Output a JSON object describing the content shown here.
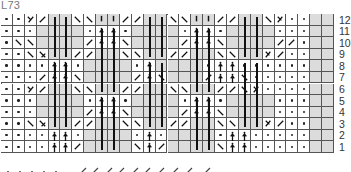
{
  "title": "L73",
  "grid": {
    "cols": 28,
    "rows": 12,
    "legend_codes": {
      "p": "purl-dot",
      "g": "gray-empty",
      "v": "short-vertical-knit",
      "r": "right-slant",
      "l": "left-slant",
      "y": "y-decrease",
      "k": "k-decrease",
      "a": "arrow-up-dot",
      "w": "white-empty"
    },
    "rows_top_to_bottom": [
      {
        "row": "12",
        "cells": [
          "p",
          "p",
          "y",
          "r",
          "g",
          "g",
          "l",
          "l",
          "v",
          "v",
          "r",
          "r",
          "g",
          "g",
          "l",
          "l",
          "v",
          "v",
          "r",
          "r",
          "g",
          "g",
          "l",
          "k",
          "p",
          "p",
          "g",
          "g"
        ]
      },
      {
        "row": "11",
        "cells": [
          "p",
          "p",
          "p",
          "g",
          "g",
          "g",
          "g",
          "p",
          "a",
          "a",
          "p",
          "g",
          "g",
          "g",
          "g",
          "p",
          "a",
          "a",
          "p",
          "g",
          "g",
          "g",
          "g",
          "p",
          "p",
          "p",
          "g",
          "g"
        ]
      },
      {
        "row": "10",
        "cells": [
          "p",
          "l",
          "l",
          "g",
          "g",
          "g",
          "g",
          "r",
          "a",
          "a",
          "l",
          "g",
          "g",
          "g",
          "g",
          "r",
          "a",
          "a",
          "l",
          "g",
          "g",
          "g",
          "g",
          "r",
          "r",
          "p",
          "g",
          "g"
        ]
      },
      {
        "row": "9",
        "cells": [
          "p",
          "p",
          "l",
          "x",
          "g",
          "g",
          "r",
          "r",
          "g",
          "g",
          "l",
          "l",
          "g",
          "g",
          "r",
          "r",
          "g",
          "g",
          "l",
          "l",
          "g",
          "g",
          "k",
          "r",
          "p",
          "p",
          "g",
          "g"
        ]
      },
      {
        "row": "8",
        "cells": [
          "p",
          "p",
          "p",
          "p",
          "a",
          "a",
          "p",
          "g",
          "g",
          "g",
          "g",
          "p",
          "a",
          "g",
          "g",
          "g",
          "g",
          "p",
          "a",
          "a",
          "p",
          "p",
          "p",
          "p",
          "p",
          "p",
          "g",
          "g"
        ]
      },
      {
        "row": "7",
        "cells": [
          "p",
          "p",
          "p",
          "r",
          "a",
          "a",
          "l",
          "g",
          "g",
          "g",
          "g",
          "r",
          "a",
          "l",
          "g",
          "g",
          "g",
          "r",
          "a",
          "a",
          "l",
          "p",
          "p",
          "p",
          "p",
          "p",
          "g",
          "g"
        ]
      },
      {
        "row": "6",
        "cells": [
          "p",
          "p",
          "y",
          "r",
          "g",
          "g",
          "l",
          "l",
          "g",
          "g",
          "r",
          "r",
          "g",
          "g",
          "l",
          "l",
          "g",
          "g",
          "r",
          "r",
          "l",
          "k",
          "p",
          "p",
          "p",
          "p",
          "g",
          "g"
        ]
      },
      {
        "row": "5",
        "cells": [
          "p",
          "p",
          "p",
          "g",
          "g",
          "g",
          "g",
          "p",
          "a",
          "a",
          "p",
          "g",
          "g",
          "g",
          "g",
          "p",
          "a",
          "a",
          "p",
          "g",
          "g",
          "g",
          "g",
          "p",
          "p",
          "p",
          "g",
          "g"
        ]
      },
      {
        "row": "4",
        "cells": [
          "p",
          "p",
          "p",
          "g",
          "g",
          "g",
          "g",
          "r",
          "a",
          "a",
          "l",
          "g",
          "g",
          "g",
          "g",
          "r",
          "a",
          "a",
          "l",
          "g",
          "g",
          "g",
          "g",
          "p",
          "p",
          "p",
          "g",
          "g"
        ]
      },
      {
        "row": "3",
        "cells": [
          "p",
          "p",
          "l",
          "x",
          "g",
          "g",
          "r",
          "r",
          "g",
          "g",
          "l",
          "l",
          "g",
          "g",
          "r",
          "r",
          "g",
          "g",
          "l",
          "l",
          "g",
          "g",
          "k",
          "r",
          "p",
          "p",
          "g",
          "g"
        ]
      },
      {
        "row": "2",
        "cells": [
          "p",
          "p",
          "p",
          "p",
          "a",
          "a",
          "p",
          "g",
          "g",
          "g",
          "g",
          "p",
          "a",
          "p",
          "g",
          "g",
          "g",
          "g",
          "p",
          "a",
          "a",
          "p",
          "p",
          "p",
          "p",
          "p",
          "g",
          "g"
        ]
      },
      {
        "row": "1",
        "cells": [
          "p",
          "p",
          "p",
          "p",
          "a",
          "a",
          "r",
          "g",
          "g",
          "g",
          "g",
          "l",
          "a",
          "r",
          "g",
          "g",
          "g",
          "g",
          "l",
          "a",
          "a",
          "p",
          "p",
          "p",
          "p",
          "p",
          "g",
          "g"
        ]
      }
    ]
  },
  "row_numbers": [
    "12",
    "11",
    "10",
    "9",
    "8",
    "7",
    "6",
    "5",
    "4",
    "3",
    "2",
    "1"
  ]
}
